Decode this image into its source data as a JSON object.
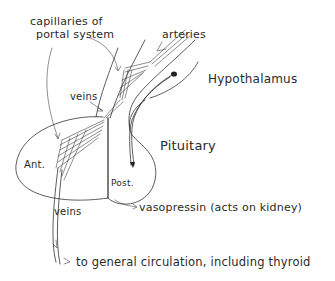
{
  "diagram": {
    "labels": {
      "capillaries_line1": "capillaries of",
      "capillaries_line2": "portal system",
      "arteries": "arteries",
      "hypothalamus": "Hypothalamus",
      "veins_upper": "veins",
      "pituitary": "Pituitary",
      "anterior": "Ant.",
      "posterior": "Post.",
      "veins_lower": "veins",
      "vasopressin": "vasopressin (acts on kidney)",
      "general_circulation": "to general circulation, including thyroid"
    },
    "colors": {
      "ink": "#333333",
      "background": "#ffffff"
    }
  }
}
